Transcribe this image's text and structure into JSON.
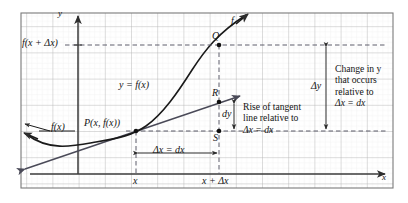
{
  "figure": {
    "kind": "calculus-differential-diagram",
    "frame": {
      "x": 21,
      "y": 13,
      "width": 372,
      "height": 175
    },
    "grid": {
      "cell": 26.2,
      "minor_cell": 5.24,
      "major_color": "#b9b9b9",
      "minor_color": "#e6e6e6"
    },
    "border_color": "#777777",
    "curve_color": "#1a1a1a",
    "tangent_color": "#4a4a58",
    "axis_color": "#3a3a3a",
    "dashed_color": "#5d5d6b"
  },
  "axes": {
    "y_label": "y",
    "x_label": "x",
    "origin": {
      "x": 78,
      "y": 174
    },
    "y_axis_top": 17,
    "x_axis_right": 385
  },
  "points": {
    "P": {
      "label": "P(x, f(x))",
      "cx": 136,
      "cy": 131
    },
    "Q": {
      "label": "Q",
      "cx": 219,
      "cy": 45
    },
    "R": {
      "label": "R",
      "cx": 219,
      "cy": 102
    },
    "S": {
      "label": "S",
      "cx": 219,
      "cy": 131
    }
  },
  "labels": {
    "f_of_x_plus_dx": "f(x + Δx)",
    "y_equals_f_of_x": "y = f(x)",
    "f_of_x": "f(x)",
    "curve_f": "f",
    "dy": "dy",
    "delta_y": "Δy",
    "delta_x_equals_dx": "Δx = dx",
    "x_tick": "x",
    "x_plus_delta_x_tick": "x + Δx"
  },
  "annotations": {
    "tangent_rise": {
      "lines": [
        "Rise of tangent",
        "line relative to",
        "Δx = dx"
      ],
      "italic_line_index": 2
    },
    "change_in_y": {
      "lines": [
        "Change in y",
        "that occurs",
        "relative to",
        "Δx = dx"
      ],
      "italic_line_index": 3
    }
  },
  "measure_labels": {
    "delta_x_bracket": "Δx = dx",
    "dy_bracket": "dy",
    "delta_y_bracket": "Δy"
  }
}
